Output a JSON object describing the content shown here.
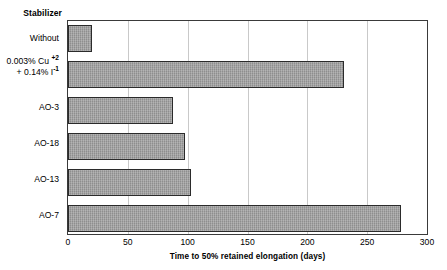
{
  "chart_data": {
    "type": "bar",
    "orientation": "horizontal",
    "title": "",
    "xlabel": "Time to 50% retained elongation (days)",
    "ylabel": "Stabilizer",
    "categories": [
      "Without",
      "0.003% Cu +2 + 0.14% I -1",
      "AO-3",
      "AO-18",
      "AO-13",
      "AO-7"
    ],
    "values": [
      20,
      231,
      88,
      98,
      103,
      278
    ],
    "xlim": [
      0,
      300
    ],
    "xticks": [
      0,
      50,
      100,
      150,
      200,
      250,
      300
    ],
    "grid": "vertical",
    "legend": "none",
    "bar_color": "#9c9c9c",
    "bar_border_color": "#2b2b2b",
    "grid_color": "#c9c9c9",
    "frame_color": "#3a3a3a",
    "background": "#ffffff"
  },
  "axis": {
    "y_heading": "Stabilizer",
    "x_title": "Time to 50% retained elongation (days)",
    "tick_labels": [
      "0",
      "50",
      "100",
      "150",
      "200",
      "250",
      "300"
    ]
  },
  "categories": [
    {
      "label": "Without",
      "line1": "Without",
      "line2": "",
      "value": 20
    },
    {
      "label": "0.003% Cu +2 + 0.14% I -1",
      "line1_pre": "0.003% Cu ",
      "line1_sup": "+2",
      "line2_pre": "+ 0.14% I",
      "line2_sup": "-1",
      "value": 231
    },
    {
      "label": "AO-3",
      "line1": "AO-3",
      "line2": "",
      "value": 88
    },
    {
      "label": "AO-18",
      "line1": "AO-18",
      "line2": "",
      "value": 98
    },
    {
      "label": "AO-13",
      "line1": "AO-13",
      "line2": "",
      "value": 103
    },
    {
      "label": "AO-7",
      "line1": "AO-7",
      "line2": "",
      "value": 278
    }
  ]
}
